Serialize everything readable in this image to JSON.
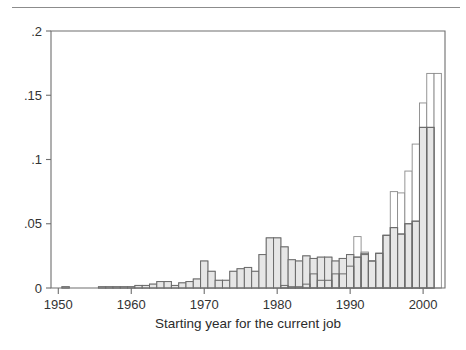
{
  "figure": {
    "name": "overlaid-histogram-job-start-year",
    "top_rule": true
  },
  "chart_data": {
    "type": "bar",
    "title": "",
    "subtitle": "",
    "xlabel": "Starting year for the current job",
    "ylabel": "",
    "xlim": [
      1949,
      2003
    ],
    "ylim": [
      0,
      0.2
    ],
    "grid": false,
    "legend": "none",
    "xticks": [
      1950,
      1960,
      1970,
      1980,
      1990,
      2000
    ],
    "xticklabels": [
      "1950",
      "1960",
      "1970",
      "1980",
      "1990",
      "2000"
    ],
    "yticks": [
      0,
      0.05,
      0.1,
      0.15,
      0.2
    ],
    "yticklabels": [
      "0",
      ".05",
      ".1",
      ".15",
      ".2"
    ],
    "bar_style": {
      "back_fill": "#ffffff",
      "back_stroke": "#8a8a8a",
      "front_fill": "#e6e6e6",
      "front_stroke": "#6b6b6b",
      "overlap": "overlaid"
    },
    "x": [
      1951,
      1956,
      1957,
      1958,
      1959,
      1960,
      1961,
      1962,
      1963,
      1964,
      1965,
      1966,
      1967,
      1968,
      1969,
      1970,
      1971,
      1972,
      1973,
      1974,
      1975,
      1976,
      1977,
      1978,
      1979,
      1980,
      1981,
      1982,
      1983,
      1984,
      1985,
      1986,
      1987,
      1988,
      1989,
      1990,
      1991,
      1992,
      1993,
      1994,
      1995,
      1996,
      1997,
      1998,
      1999,
      2000,
      2001,
      2002
    ],
    "series": [
      {
        "name": "white-outline-series",
        "fill": "#ffffff",
        "stroke": "#8a8a8a",
        "values": [
          0.001,
          0.001,
          0.001,
          0.001,
          0.001,
          0.001,
          0.002,
          0.002,
          0.003,
          0.005,
          0.005,
          0.002,
          0.004,
          0.005,
          0.007,
          0.021,
          0.013,
          0.006,
          0.006,
          0.013,
          0.015,
          0.016,
          0.013,
          0.026,
          0.039,
          0.039,
          0.032,
          0.022,
          0.021,
          0.025,
          0.023,
          0.024,
          0.024,
          0.021,
          0.023,
          0.026,
          0.04,
          0.028,
          0.021,
          0.027,
          0.041,
          0.075,
          0.074,
          0.091,
          0.112,
          0.144,
          0.167,
          0.167
        ]
      },
      {
        "name": "gray-filled-series",
        "fill": "#e6e6e6",
        "stroke": "#6b6b6b",
        "values": [
          0.001,
          0.001,
          0.001,
          0.001,
          0.001,
          0.001,
          0.002,
          0.002,
          0.003,
          0.005,
          0.005,
          0.002,
          0.004,
          0.005,
          0.007,
          0.021,
          0.013,
          0.006,
          0.006,
          0.013,
          0.015,
          0.016,
          0.013,
          0.026,
          0.039,
          0.039,
          0.032,
          0.022,
          0.021,
          0.025,
          0.023,
          0.024,
          0.024,
          0.021,
          0.023,
          0.026,
          0.024,
          0.027,
          0.021,
          0.027,
          0.041,
          0.047,
          0.042,
          0.05,
          0.052,
          0.125,
          0.125,
          0.0
        ]
      },
      {
        "name": "dark-overlay-series",
        "fill": "none",
        "stroke": "#555555",
        "values": [
          0.0,
          0.0,
          0.0,
          0.0,
          0.0,
          0.0,
          0.0,
          0.0,
          0.0,
          0.0,
          0.0,
          0.0,
          0.0,
          0.0,
          0.0,
          0.0,
          0.0,
          0.0,
          0.0,
          0.0,
          0.0,
          0.0,
          0.0,
          0.0,
          0.0,
          0.0,
          0.002,
          0.001,
          0.001,
          0.003,
          0.011,
          0.006,
          0.006,
          0.011,
          0.011,
          0.017,
          0.024,
          0.026,
          0.021,
          0.027,
          0.041,
          0.047,
          0.042,
          0.05,
          0.052,
          0.125,
          0.125,
          0.0
        ]
      }
    ]
  }
}
